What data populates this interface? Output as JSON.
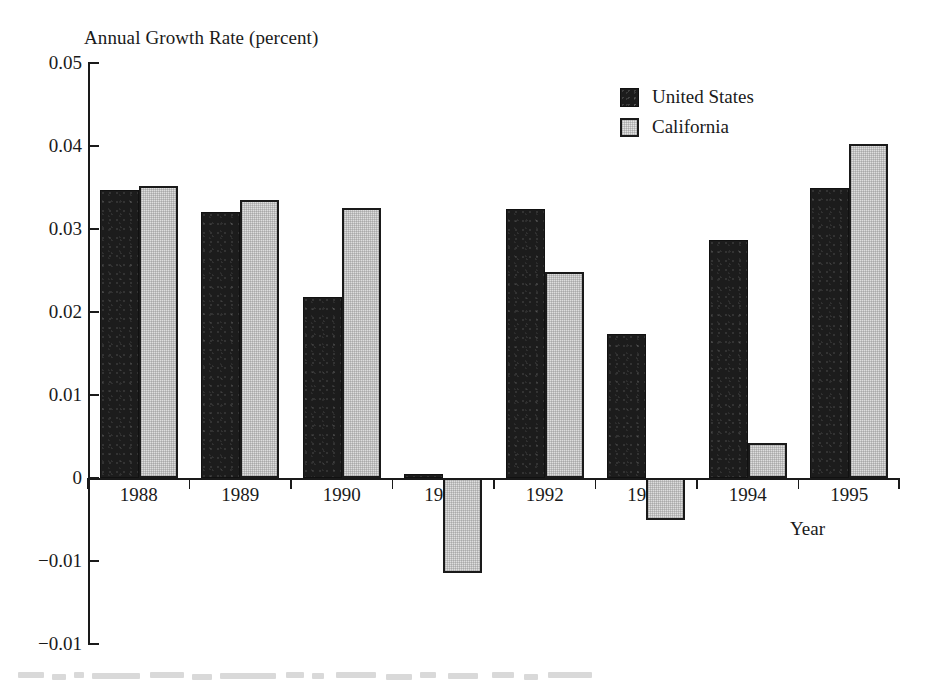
{
  "chart_data": {
    "type": "bar",
    "title": "",
    "ylabel": "Annual Growth Rate (percent)",
    "xlabel": "Year",
    "categories": [
      "1988",
      "1989",
      "1990",
      "1991",
      "1992",
      "1993",
      "1994",
      "1995"
    ],
    "series": [
      {
        "name": "United States",
        "color": "#1c1c1c",
        "values": [
          0.0347,
          0.032,
          0.0218,
          0.0005,
          0.0324,
          0.0173,
          0.0287,
          0.035
        ]
      },
      {
        "name": "California",
        "color": "#dedede",
        "values": [
          0.0352,
          0.0335,
          0.0325,
          -0.0115,
          0.0248,
          -0.005,
          0.0042,
          0.0403
        ]
      }
    ],
    "ylim": [
      -0.02,
      0.05
    ],
    "ytick_values": [
      0.05,
      0.04,
      0.03,
      0.02,
      0.01,
      0,
      -0.01,
      -0.02
    ],
    "ytick_labels": [
      "0.05",
      "0.04",
      "0.03",
      "0.02",
      "0.01",
      "0",
      "−0.01",
      "−0.01"
    ],
    "grid": false,
    "legend_position": "top-right"
  },
  "axis": {
    "y_title": "Annual Growth Rate (percent)",
    "x_title": "Year"
  },
  "legend": {
    "entries": [
      {
        "label": "United States",
        "swatch": "dark-filled-square"
      },
      {
        "label": "California",
        "swatch": "light-outlined-square"
      }
    ]
  },
  "colors": {
    "united_states": "#1c1c1c",
    "california": "#dedede",
    "axis": "#1a1a1a",
    "background": "#ffffff"
  }
}
